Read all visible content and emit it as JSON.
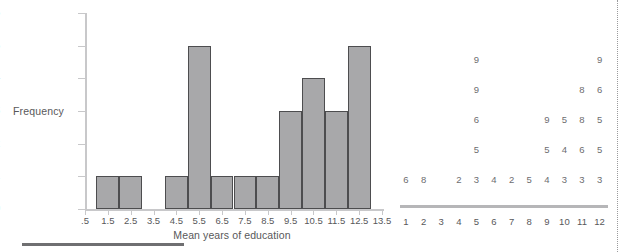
{
  "chart_data": [
    {
      "type": "bar",
      "title": "",
      "subtitle": "",
      "xlabel": "Mean years of education",
      "ylabel": "Frequency",
      "categories": [
        ".5",
        "1.5",
        "2.5",
        "3.5",
        "4.5",
        "5.5",
        "6.5",
        "7.5",
        "8.5",
        "9.5",
        "10.5",
        "11.5",
        "12.5",
        "13.5"
      ],
      "values": [
        0,
        1,
        1,
        0,
        1,
        5,
        1,
        1,
        1,
        3,
        4,
        3,
        5,
        0
      ],
      "ylim": [
        0,
        6
      ],
      "yticks": [
        "0",
        "1",
        "2",
        "3",
        "4",
        "5",
        "6"
      ],
      "grid": false,
      "legend": "none",
      "bar_fill": "#a8a8aa",
      "bar_stroke": "#4d4d4f",
      "axis_color": "#c8c8ca"
    },
    {
      "type": "table",
      "title": "",
      "xlabel": "",
      "ylabel": "",
      "categories": [
        "1",
        "2",
        "3",
        "4",
        "5",
        "6",
        "7",
        "8",
        "9",
        "10",
        "11",
        "12"
      ],
      "note": "stacked digit stem-plot; each column lists values bottom-to-top",
      "columns": [
        {
          "label": "1",
          "stack": [
            "6"
          ]
        },
        {
          "label": "2",
          "stack": [
            "8"
          ]
        },
        {
          "label": "3",
          "stack": []
        },
        {
          "label": "4",
          "stack": [
            "2"
          ]
        },
        {
          "label": "5",
          "stack": [
            "3",
            "5",
            "6",
            "9",
            "9"
          ]
        },
        {
          "label": "6",
          "stack": [
            "4"
          ]
        },
        {
          "label": "7",
          "stack": [
            "2"
          ]
        },
        {
          "label": "8",
          "stack": [
            "5"
          ]
        },
        {
          "label": "9",
          "stack": [
            "4",
            "5",
            "9"
          ]
        },
        {
          "label": "10",
          "stack": [
            "3",
            "4",
            "5"
          ]
        },
        {
          "label": "11",
          "stack": [
            "3",
            "6",
            "8",
            "8"
          ]
        },
        {
          "label": "12",
          "stack": [
            "3",
            "5",
            "5",
            "6",
            "9"
          ]
        }
      ],
      "axis_color": "#b6b6b8",
      "text_color": "#6d6d6f"
    }
  ],
  "histogram": {
    "ylabel": "Frequency",
    "xlabel": "Mean years of education"
  },
  "dotplot": {
    "rows": [
      {
        "index": 4,
        "cells": [
          {
            "col": "5",
            "v": "9"
          },
          {
            "col": "12",
            "v": "9"
          }
        ]
      },
      {
        "index": 3,
        "cells": [
          {
            "col": "5",
            "v": "9"
          },
          {
            "col": "11",
            "v": "8"
          },
          {
            "col": "12",
            "v": "6"
          }
        ]
      },
      {
        "index": 2,
        "cells": [
          {
            "col": "5",
            "v": "6"
          },
          {
            "col": "9",
            "v": "9"
          },
          {
            "col": "10",
            "v": "5"
          },
          {
            "col": "11",
            "v": "8"
          },
          {
            "col": "12",
            "v": "5"
          }
        ]
      },
      {
        "index": 1,
        "cells": [
          {
            "col": "5",
            "v": "5"
          },
          {
            "col": "9",
            "v": "5"
          },
          {
            "col": "10",
            "v": "4"
          },
          {
            "col": "11",
            "v": "6"
          },
          {
            "col": "12",
            "v": "5"
          }
        ]
      },
      {
        "index": 0,
        "cells": [
          {
            "col": "1",
            "v": "6"
          },
          {
            "col": "2",
            "v": "8"
          },
          {
            "col": "4",
            "v": "2"
          },
          {
            "col": "5",
            "v": "3"
          },
          {
            "col": "6",
            "v": "4"
          },
          {
            "col": "7",
            "v": "2"
          },
          {
            "col": "8",
            "v": "5"
          },
          {
            "col": "9",
            "v": "4"
          },
          {
            "col": "10",
            "v": "3"
          },
          {
            "col": "11",
            "v": "3"
          },
          {
            "col": "12",
            "v": "3"
          }
        ]
      }
    ]
  }
}
